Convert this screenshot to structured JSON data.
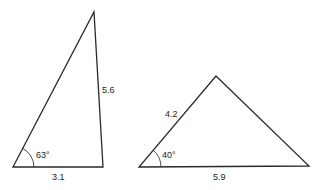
{
  "diagram": {
    "type": "triangles",
    "triangles": [
      {
        "id": "triangle-1",
        "vertices": [
          [
            13,
            167
          ],
          [
            103,
            167
          ],
          [
            94,
            12
          ]
        ],
        "labels": {
          "side_base": "3.1",
          "side_right": "5.6",
          "angle_left": "63°"
        }
      },
      {
        "id": "triangle-2",
        "vertices": [
          [
            139,
            167
          ],
          [
            309,
            166
          ],
          [
            216,
            76
          ]
        ],
        "labels": {
          "side_left": "4.2",
          "side_base": "5.9",
          "angle_left": "40°"
        }
      }
    ]
  }
}
